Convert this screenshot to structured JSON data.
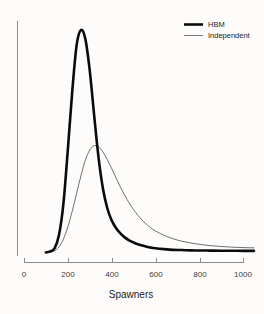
{
  "chart_data": {
    "type": "line",
    "title": "",
    "subtitle": "",
    "xlabel": "Spawners",
    "ylabel": "",
    "xlim": [
      0,
      1060
    ],
    "ylim": [
      0,
      1.0
    ],
    "grid": false,
    "legend_position": "top-right",
    "xticks": [
      0,
      200,
      400,
      600,
      800,
      1000
    ],
    "xtick_labels": [
      "0",
      "200",
      "400",
      "600",
      "800",
      "1000"
    ],
    "yticks": [],
    "ytick_labels": [],
    "x": [
      100,
      120,
      140,
      160,
      180,
      200,
      220,
      240,
      260,
      280,
      300,
      320,
      340,
      360,
      380,
      400,
      420,
      440,
      460,
      480,
      500,
      520,
      540,
      560,
      580,
      600,
      640,
      680,
      720,
      760,
      800,
      850,
      900,
      950,
      1000,
      1050
    ],
    "series": [
      {
        "name": "HBM",
        "style": "thick-black",
        "color": "#0b0b0b",
        "linewidth": 2.6,
        "peak_x": 270,
        "peak_y": 1.0,
        "values": [
          0.0,
          0.005,
          0.02,
          0.08,
          0.22,
          0.46,
          0.72,
          0.93,
          1.0,
          0.96,
          0.82,
          0.62,
          0.43,
          0.29,
          0.2,
          0.145,
          0.11,
          0.086,
          0.068,
          0.055,
          0.045,
          0.037,
          0.031,
          0.026,
          0.022,
          0.019,
          0.015,
          0.012,
          0.011,
          0.0095,
          0.009,
          0.0085,
          0.008,
          0.008,
          0.0075,
          0.0075
        ]
      },
      {
        "name": "Independent",
        "style": "thin-gray",
        "color": "#555555",
        "linewidth": 0.85,
        "peak_x": 320,
        "peak_y": 0.48,
        "values": [
          0.0,
          0.002,
          0.008,
          0.025,
          0.06,
          0.115,
          0.185,
          0.265,
          0.345,
          0.415,
          0.46,
          0.48,
          0.475,
          0.452,
          0.418,
          0.378,
          0.336,
          0.295,
          0.257,
          0.223,
          0.193,
          0.167,
          0.145,
          0.126,
          0.11,
          0.097,
          0.077,
          0.062,
          0.051,
          0.043,
          0.037,
          0.031,
          0.027,
          0.024,
          0.022,
          0.021
        ]
      }
    ],
    "legend": [
      {
        "label": "HBM",
        "style": "thick-black"
      },
      {
        "label": "Independent",
        "style": "thin-gray"
      }
    ]
  },
  "colors": {
    "background": "#fdfcfb",
    "hbm": "#0b0b0b",
    "independent": "#555555",
    "axis": "#8a8a8a",
    "text": "#222222"
  }
}
